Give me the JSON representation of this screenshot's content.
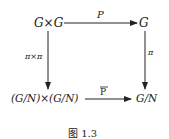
{
  "diagram": {
    "nodes": {
      "top_left": "G×G",
      "top_right": "G",
      "bottom_left": "(G/N)×(G/N)",
      "bottom_right": "G/N"
    },
    "arrows": {
      "top": "P",
      "left": "π×π",
      "right": "π",
      "bottom": "P"
    },
    "caption": "图 1.3"
  }
}
